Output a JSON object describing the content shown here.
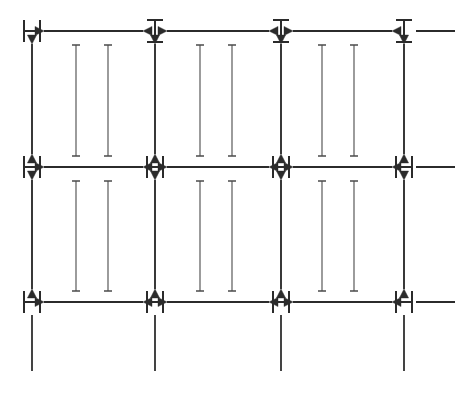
{
  "figure": {
    "title": "",
    "canvas": {
      "width": 463,
      "height": 399,
      "background": "#ffffff"
    },
    "stroke_color": "#2b2b2b",
    "glyph_color": "#2b2b2b",
    "beam_color": "#4a4a4a",
    "main_stroke_width": 2.2,
    "beam_stroke_width": 1.1
  },
  "grid": {
    "columns_x": [
      32,
      155,
      281,
      404
    ],
    "rows_y": [
      31,
      167,
      302
    ],
    "column_count": 4,
    "row_count": 3
  },
  "nodes": [
    {
      "id": "n-r0-c0",
      "row": 0,
      "col": 0,
      "x": 32,
      "y": 31,
      "glyph": "H",
      "glyph_label": "H-node"
    },
    {
      "id": "n-r0-c1",
      "row": 0,
      "col": 1,
      "x": 155,
      "y": 31,
      "glyph": "I",
      "glyph_label": "I-node"
    },
    {
      "id": "n-r0-c2",
      "row": 0,
      "col": 2,
      "x": 281,
      "y": 31,
      "glyph": "I",
      "glyph_label": "I-node"
    },
    {
      "id": "n-r0-c3",
      "row": 0,
      "col": 3,
      "x": 404,
      "y": 31,
      "glyph": "I",
      "glyph_label": "I-node"
    },
    {
      "id": "n-r1-c0",
      "row": 1,
      "col": 0,
      "x": 32,
      "y": 167,
      "glyph": "H",
      "glyph_label": "H-node"
    },
    {
      "id": "n-r1-c1",
      "row": 1,
      "col": 1,
      "x": 155,
      "y": 167,
      "glyph": "H",
      "glyph_label": "H-node"
    },
    {
      "id": "n-r1-c2",
      "row": 1,
      "col": 2,
      "x": 281,
      "y": 167,
      "glyph": "H",
      "glyph_label": "H-node"
    },
    {
      "id": "n-r1-c3",
      "row": 1,
      "col": 3,
      "x": 404,
      "y": 167,
      "glyph": "H",
      "glyph_label": "H-node"
    },
    {
      "id": "n-r2-c0",
      "row": 2,
      "col": 0,
      "x": 32,
      "y": 302,
      "glyph": "H",
      "glyph_label": "H-node"
    },
    {
      "id": "n-r2-c1",
      "row": 2,
      "col": 1,
      "x": 155,
      "y": 302,
      "glyph": "H",
      "glyph_label": "H-node"
    },
    {
      "id": "n-r2-c2",
      "row": 2,
      "col": 2,
      "x": 281,
      "y": 302,
      "glyph": "H",
      "glyph_label": "H-node"
    },
    {
      "id": "n-r2-c3",
      "row": 2,
      "col": 3,
      "x": 404,
      "y": 302,
      "glyph": "H",
      "glyph_label": "H-node"
    }
  ],
  "horizontal_connectors": [
    {
      "id": "h-r0-c0c1",
      "row": 0,
      "y": 31,
      "x1": 44,
      "x2": 143,
      "arrow_start": true,
      "arrow_end": true
    },
    {
      "id": "h-r0-c1c2",
      "row": 0,
      "y": 31,
      "x1": 167,
      "x2": 269,
      "arrow_start": true,
      "arrow_end": true
    },
    {
      "id": "h-r0-c2c3",
      "row": 0,
      "y": 31,
      "x1": 293,
      "x2": 392,
      "arrow_start": true,
      "arrow_end": true
    },
    {
      "id": "h-r1-c0c1",
      "row": 1,
      "y": 167,
      "x1": 44,
      "x2": 143,
      "arrow_start": true,
      "arrow_end": true
    },
    {
      "id": "h-r1-c1c2",
      "row": 1,
      "y": 167,
      "x1": 167,
      "x2": 269,
      "arrow_start": true,
      "arrow_end": true
    },
    {
      "id": "h-r1-c2c3",
      "row": 1,
      "y": 167,
      "x1": 293,
      "x2": 392,
      "arrow_start": true,
      "arrow_end": true
    },
    {
      "id": "h-r2-c0c1",
      "row": 2,
      "y": 302,
      "x1": 44,
      "x2": 143,
      "arrow_start": true,
      "arrow_end": true
    },
    {
      "id": "h-r2-c1c2",
      "row": 2,
      "y": 302,
      "x1": 167,
      "x2": 269,
      "arrow_start": true,
      "arrow_end": true
    },
    {
      "id": "h-r2-c2c3",
      "row": 2,
      "y": 302,
      "x1": 293,
      "x2": 392,
      "arrow_start": true,
      "arrow_end": true
    }
  ],
  "horizontal_stubs": [
    {
      "id": "stub-r0-right",
      "row": 0,
      "y": 31,
      "x1": 416,
      "x2": 455
    },
    {
      "id": "stub-r1-right",
      "row": 1,
      "y": 167,
      "x1": 416,
      "x2": 455
    },
    {
      "id": "stub-r2-right",
      "row": 2,
      "y": 302,
      "x1": 416,
      "x2": 455
    }
  ],
  "vertical_connectors": [
    {
      "id": "v-c0-r0r1",
      "col": 0,
      "x": 32,
      "y1": 44,
      "y2": 154,
      "arrow_start": true,
      "arrow_end": true
    },
    {
      "id": "v-c1-r0r1",
      "col": 1,
      "x": 155,
      "y1": 44,
      "y2": 154,
      "arrow_start": true,
      "arrow_end": true
    },
    {
      "id": "v-c2-r0r1",
      "col": 2,
      "x": 281,
      "y1": 44,
      "y2": 154,
      "arrow_start": true,
      "arrow_end": true
    },
    {
      "id": "v-c3-r0r1",
      "col": 3,
      "x": 404,
      "y1": 44,
      "y2": 154,
      "arrow_start": true,
      "arrow_end": true
    },
    {
      "id": "v-c0-r1r2",
      "col": 0,
      "x": 32,
      "y1": 180,
      "y2": 289,
      "arrow_start": true,
      "arrow_end": true
    },
    {
      "id": "v-c1-r1r2",
      "col": 1,
      "x": 155,
      "y1": 180,
      "y2": 289,
      "arrow_start": true,
      "arrow_end": true
    },
    {
      "id": "v-c2-r1r2",
      "col": 2,
      "x": 281,
      "y1": 180,
      "y2": 289,
      "arrow_start": true,
      "arrow_end": true
    },
    {
      "id": "v-c3-r1r2",
      "col": 3,
      "x": 404,
      "y1": 180,
      "y2": 289,
      "arrow_start": true,
      "arrow_end": true
    }
  ],
  "vertical_stubs": [
    {
      "id": "stub-c0-bottom",
      "col": 0,
      "x": 32,
      "y1": 315,
      "y2": 371
    },
    {
      "id": "stub-c1-bottom",
      "col": 1,
      "x": 155,
      "y1": 315,
      "y2": 371
    },
    {
      "id": "stub-c2-bottom",
      "col": 2,
      "x": 281,
      "y1": 315,
      "y2": 371
    },
    {
      "id": "stub-c3-bottom",
      "col": 3,
      "x": 404,
      "y1": 315,
      "y2": 371
    }
  ],
  "ibeams": [
    {
      "id": "beam-b0-r0",
      "x": 76,
      "y1": 45,
      "y2": 156,
      "band": 0,
      "row_band": 0
    },
    {
      "id": "beam-b1-r0",
      "x": 108,
      "y1": 45,
      "y2": 156,
      "band": 1,
      "row_band": 0
    },
    {
      "id": "beam-b2-r0",
      "x": 200,
      "y1": 45,
      "y2": 156,
      "band": 2,
      "row_band": 0
    },
    {
      "id": "beam-b3-r0",
      "x": 232,
      "y1": 45,
      "y2": 156,
      "band": 3,
      "row_band": 0
    },
    {
      "id": "beam-b4-r0",
      "x": 322,
      "y1": 45,
      "y2": 156,
      "band": 4,
      "row_band": 0
    },
    {
      "id": "beam-b5-r0",
      "x": 354,
      "y1": 45,
      "y2": 156,
      "band": 5,
      "row_band": 0
    },
    {
      "id": "beam-b0-r1",
      "x": 76,
      "y1": 181,
      "y2": 291,
      "band": 0,
      "row_band": 1
    },
    {
      "id": "beam-b1-r1",
      "x": 108,
      "y1": 181,
      "y2": 291,
      "band": 1,
      "row_band": 1
    },
    {
      "id": "beam-b2-r1",
      "x": 200,
      "y1": 181,
      "y2": 291,
      "band": 2,
      "row_band": 1
    },
    {
      "id": "beam-b3-r1",
      "x": 232,
      "y1": 181,
      "y2": 291,
      "band": 3,
      "row_band": 1
    },
    {
      "id": "beam-b4-r1",
      "x": 322,
      "y1": 181,
      "y2": 291,
      "band": 4,
      "row_band": 1
    },
    {
      "id": "beam-b5-r1",
      "x": 354,
      "y1": 181,
      "y2": 291,
      "band": 5,
      "row_band": 1
    }
  ],
  "legend": {
    "h_node_meaning": "H",
    "i_node_meaning": "I"
  }
}
